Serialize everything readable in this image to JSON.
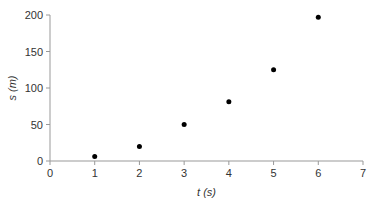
{
  "chart_data": {
    "type": "scatter",
    "title": "",
    "xlabel": "t (s)",
    "ylabel": "s (m)",
    "xlabel_parts": {
      "var": "t",
      "unit": "(s)"
    },
    "ylabel_parts": {
      "var": "s",
      "unit": "(m)"
    },
    "x": [
      1,
      2,
      3,
      4,
      5,
      6
    ],
    "y": [
      6,
      20,
      50,
      81,
      125,
      197
    ],
    "xlim": [
      0,
      7
    ],
    "ylim": [
      0,
      200
    ],
    "xticks": [
      0,
      1,
      2,
      3,
      4,
      5,
      6,
      7
    ],
    "yticks": [
      0,
      50,
      100,
      150,
      200
    ],
    "grid": false,
    "legend": null,
    "colors": {
      "points": "#000000",
      "axis": "#999999",
      "text": "#333333"
    }
  }
}
